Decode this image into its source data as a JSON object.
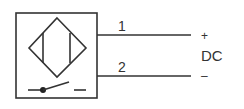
{
  "diagram": {
    "symbol": "inductive-proximity-sensor",
    "switch_type": "normally-open",
    "terminals": [
      {
        "number": "1",
        "polarity": "+"
      },
      {
        "number": "2",
        "polarity": "–"
      }
    ],
    "supply_label": "DC",
    "colors": {
      "stroke": "#333333",
      "background": "#ffffff"
    }
  }
}
